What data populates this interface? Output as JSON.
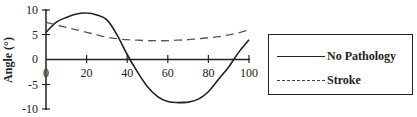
{
  "chart_data": {
    "type": "line",
    "title": "",
    "xlabel": "",
    "ylabel": "Angle (°)",
    "xlim": [
      0,
      100
    ],
    "ylim": [
      -10,
      10
    ],
    "x_ticks": [
      0,
      20,
      40,
      60,
      80,
      100
    ],
    "y_ticks": [
      10,
      5,
      0,
      -5,
      -10
    ],
    "grid": false,
    "legend_position": "right",
    "x": [
      0,
      5,
      10,
      15,
      20,
      25,
      30,
      35,
      40,
      45,
      50,
      55,
      60,
      65,
      70,
      75,
      80,
      85,
      90,
      95,
      100
    ],
    "series": [
      {
        "name": "No Pathology",
        "style": "solid",
        "values": [
          5.5,
          7.5,
          8.5,
          9.2,
          9.4,
          9.0,
          8.0,
          5.0,
          1.0,
          -2.5,
          -5.5,
          -7.5,
          -8.5,
          -8.7,
          -8.6,
          -8.0,
          -6.5,
          -4.0,
          -1.5,
          1.5,
          4.0
        ]
      },
      {
        "name": "Stroke",
        "style": "dashed",
        "values": [
          7.5,
          7.0,
          6.5,
          6.0,
          5.5,
          5.0,
          4.5,
          4.2,
          4.0,
          3.9,
          3.8,
          3.8,
          3.8,
          3.9,
          4.0,
          4.2,
          4.4,
          4.6,
          5.0,
          5.4,
          6.0
        ]
      }
    ]
  },
  "axis": {
    "ylabel": "Angle (°)",
    "y_tick_labels": [
      "10",
      "5",
      "0",
      "-5",
      "-10"
    ],
    "x_tick_labels": [
      "0",
      "20",
      "40",
      "60",
      "80",
      "100"
    ]
  },
  "legend": {
    "items": [
      {
        "label": "No Pathology",
        "style": "solid"
      },
      {
        "label": "Stroke",
        "style": "dashed"
      }
    ]
  }
}
